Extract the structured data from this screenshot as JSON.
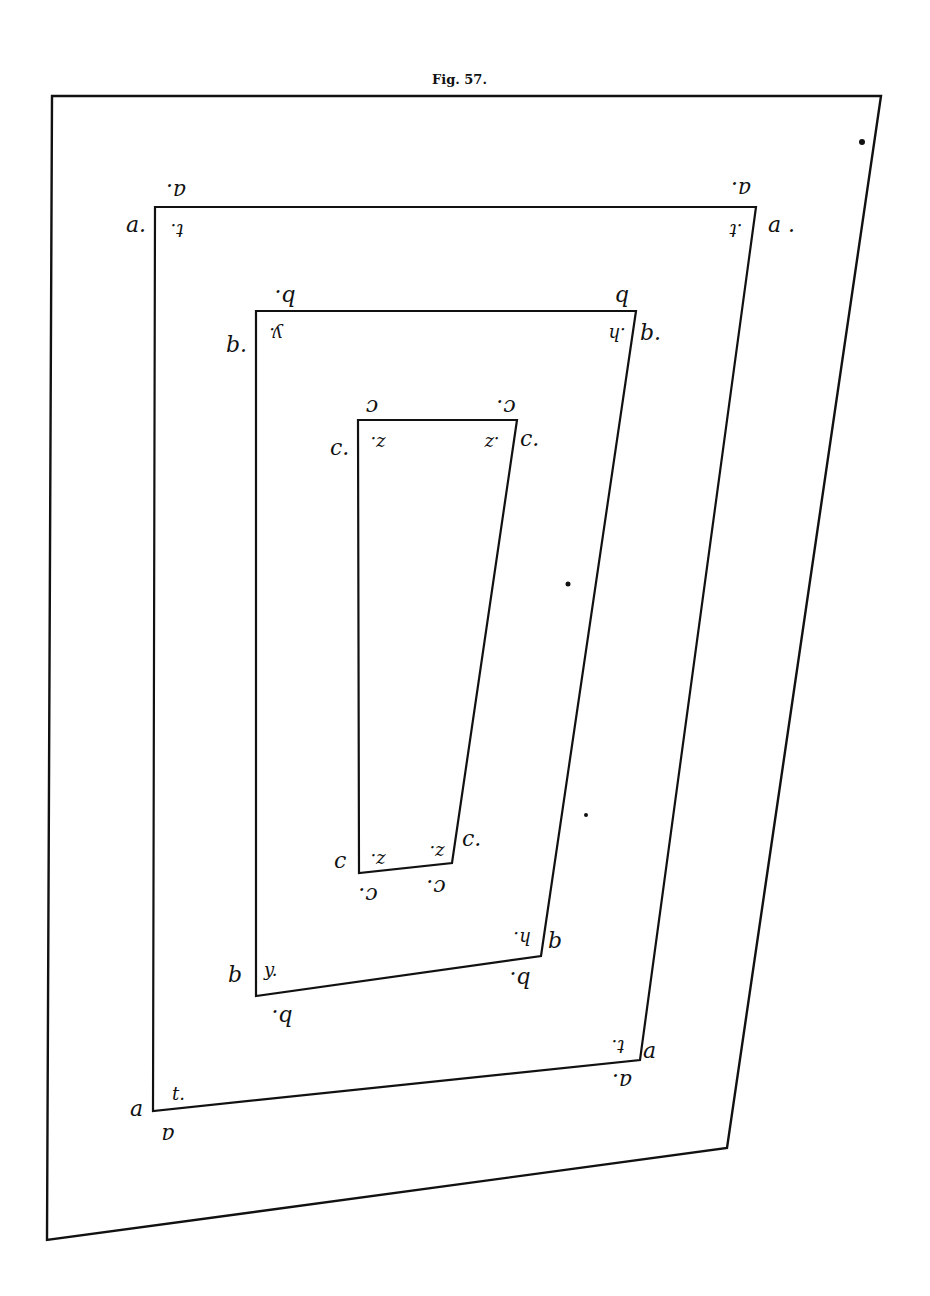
{
  "figure": {
    "caption": "Fig. 57.",
    "background": "#ffffff",
    "ink_color": "#111111"
  },
  "outer_frame": {
    "points": "52,96 881,96 727,1148 47,1240"
  },
  "rectangles": [
    {
      "id": "a",
      "points": "155,207 756,207 640,1060 153,1111",
      "labels": {
        "top_left_above": "a.",
        "top_left_side": "a.",
        "top_left_inner": "t.",
        "top_right_above": "a.",
        "top_right_side": "a .",
        "top_right_inner": ".t",
        "bottom_right_side": "a",
        "bottom_right_inner": "t.",
        "bottom_right_below": "a.",
        "bottom_left_side": "a",
        "bottom_left_inner": "t.",
        "bottom_left_below": "a"
      }
    },
    {
      "id": "b",
      "points": "256,311 636,311 541,956 256,996",
      "labels": {
        "top_left_above": "b.",
        "top_left_side": "b.",
        "top_left_inner": "y.",
        "top_right_above": "b",
        "top_right_side": "b.",
        "top_right_inner": ".h",
        "bottom_right_side": "b",
        "bottom_right_inner": "h.",
        "bottom_right_below": "b.",
        "bottom_left_side": "b",
        "bottom_left_inner": "y.",
        "bottom_left_below": "b."
      }
    },
    {
      "id": "c",
      "points": "358,420 517,420 452,863 359,873",
      "labels": {
        "top_left_above": "c",
        "top_left_side": "c.",
        "top_left_inner": "z.",
        "top_right_above": "c.",
        "top_right_side": "c.",
        "top_right_inner": ".z",
        "bottom_right_side": "c.",
        "bottom_right_inner": "z.",
        "bottom_right_below": "c.",
        "bottom_left_side": "c",
        "bottom_left_inner": "z.",
        "bottom_left_below": "c."
      }
    }
  ],
  "stray_dots": [
    {
      "x": 862,
      "y": 142
    },
    {
      "x": 568,
      "y": 584
    },
    {
      "x": 586,
      "y": 815
    }
  ]
}
